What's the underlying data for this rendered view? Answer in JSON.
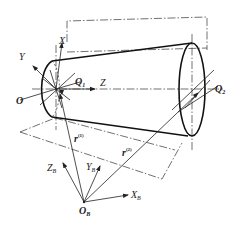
{
  "figure": {
    "colors": {
      "line": "#222222",
      "background": "#ffffff"
    }
  },
  "labels": {
    "origin_O": "O",
    "axis_Y": "Y",
    "axis_X": "X",
    "axis_Z": "Z",
    "point_Q1": "Q",
    "point_Q1_sub": "1",
    "point_Q2": "Q",
    "point_Q2_sub": "2",
    "base_origin": "O",
    "base_origin_sub": "B",
    "base_axis_Z": "Z",
    "base_axis_Z_sub": "B",
    "base_axis_Y": "Y",
    "base_axis_Y_sub": "B",
    "base_axis_X": "X",
    "base_axis_X_sub": "B",
    "vector_r1": "r",
    "vector_r1_sup": "(1)",
    "vector_r2": "r",
    "vector_r2_sup": "(2)"
  }
}
